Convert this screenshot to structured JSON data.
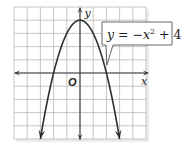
{
  "chart_data": {
    "type": "line",
    "title": "",
    "equation_label": "y = −x² + 4",
    "function": "y = -x^2 + 4",
    "xlabel": "x",
    "ylabel": "y",
    "origin_label": "O",
    "xlim": [
      -5,
      5
    ],
    "ylim": [
      -5,
      5
    ],
    "grid": true,
    "grid_step": 1,
    "curve_domain": [
      -3,
      3
    ],
    "vertex": [
      0,
      4
    ],
    "roots": [
      -2,
      2
    ],
    "sample_points": {
      "x": [
        -3,
        -2,
        -1,
        0,
        1,
        2,
        3
      ],
      "y": [
        -5,
        0,
        3,
        4,
        3,
        0,
        -5
      ]
    },
    "arrows_on_curve_ends": true,
    "callout_anchor": [
      2,
      0.6
    ]
  },
  "labels": {
    "x_axis": "x",
    "y_axis": "y",
    "origin": "O",
    "equation_prefix": "y = −x",
    "equation_exponent": "2",
    "equation_suffix": " + 4"
  },
  "colors": {
    "grid": "#b8b8b8",
    "axis": "#3a3a3a",
    "curve": "#2e2e2e",
    "callout_border": "#555555",
    "shadow": "#e4e4e4",
    "background": "#ffffff"
  }
}
